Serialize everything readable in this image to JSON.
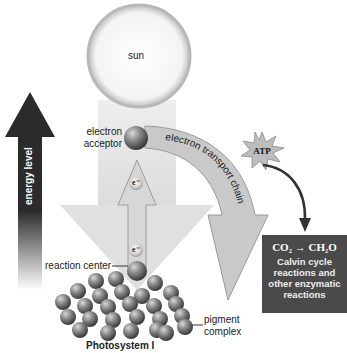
{
  "diagram": {
    "sun_label": "sun",
    "energy_axis_label": "energy level",
    "electron_acceptor_label": [
      "electron",
      "acceptor"
    ],
    "electron_symbol": "e⁻",
    "electron_transport_chain_label": "electron transport chain",
    "atp_label": "ATP",
    "reaction_center_label": "reaction center",
    "pigment_complex_label": [
      "pigment",
      "complex"
    ],
    "photosystem_label": "Photosystem I",
    "calvin_box": {
      "equation_left": "CO₂",
      "equation_arrow": "→",
      "equation_right": "CH₂O",
      "lines": [
        "Calvin cycle",
        "reactions and",
        "other enzymatic",
        "reactions"
      ]
    },
    "colors": {
      "energy_arrow": "#2a2a2a",
      "light_beam": "#e6e6e6",
      "etc_band": "#c8c8c8",
      "calvin_box": "#4a4a4a",
      "sphere": "#7a7a7a"
    }
  }
}
